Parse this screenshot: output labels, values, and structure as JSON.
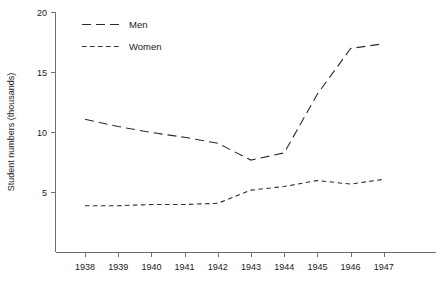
{
  "chart_data": {
    "type": "line",
    "title": "",
    "subtitle": "",
    "xlabel": "",
    "ylabel": "Student numbers (thousands)",
    "categories": [
      "1938",
      "1939",
      "1940",
      "1941",
      "1942",
      "1943",
      "1944",
      "1945",
      "1946",
      "1947"
    ],
    "x_tick_labels": [
      "1938",
      "1939",
      "1940",
      "1941",
      "1942",
      "1943",
      "1944",
      "1945",
      "1946",
      "1947"
    ],
    "y_tick_labels": [
      "5",
      "10",
      "15",
      "20"
    ],
    "y_ticks": [
      5,
      10,
      15,
      20
    ],
    "ylim": [
      0,
      20
    ],
    "grid": false,
    "legend_position": "top-left",
    "series": [
      {
        "name": "Men",
        "dash_style": "long-dash",
        "color": "#2b2b2b",
        "values": [
          11.1,
          10.5,
          10.0,
          9.6,
          9.1,
          7.7,
          8.3,
          13.2,
          17.0,
          17.4
        ]
      },
      {
        "name": "Women",
        "dash_style": "short-dash",
        "color": "#2b2b2b",
        "values": [
          3.9,
          3.9,
          4.0,
          4.0,
          4.1,
          5.2,
          5.5,
          6.0,
          5.7,
          6.1
        ]
      }
    ]
  },
  "legend": {
    "entries": [
      {
        "label": "Men"
      },
      {
        "label": "Women"
      }
    ]
  },
  "axes": {
    "y_axis_title": "Student numbers (thousands)"
  },
  "caption": {
    "text": ""
  }
}
